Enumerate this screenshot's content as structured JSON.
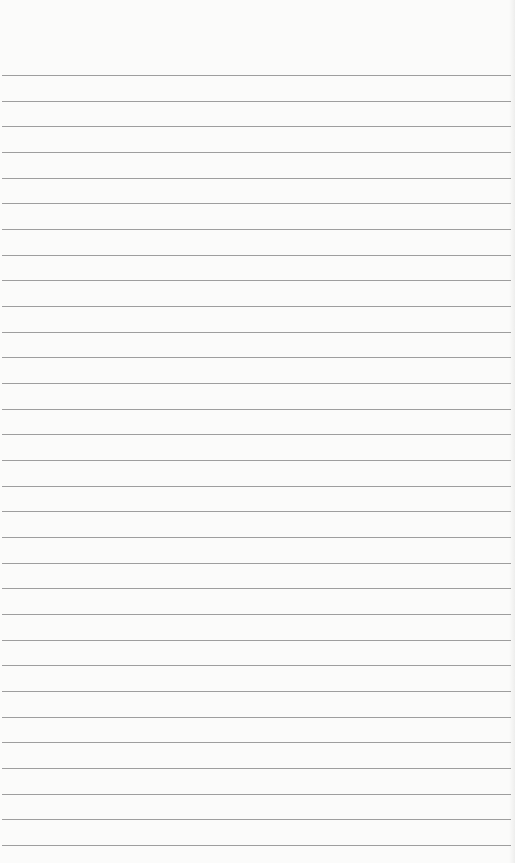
{
  "page": {
    "type": "ruled-paper",
    "paper_color": "#fbfbfa",
    "rule_color": "#8d8d8d",
    "rule_count": 31,
    "first_rule_y": 75,
    "rule_spacing": 25.67,
    "rule_left": 2,
    "rule_right": 511,
    "text": ""
  }
}
